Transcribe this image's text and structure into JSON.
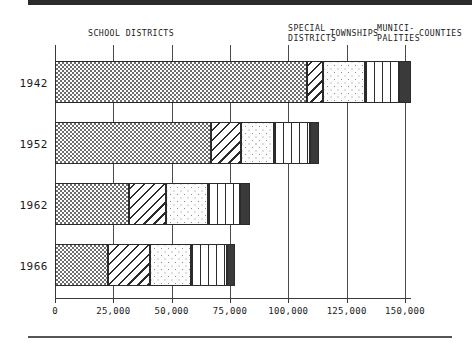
{
  "chart_data": {
    "type": "bar",
    "orientation": "horizontal",
    "stacked": true,
    "title": "",
    "xlabel": "",
    "ylabel": "",
    "categories": [
      "1942",
      "1952",
      "1962",
      "1966"
    ],
    "series": [
      {
        "name": "SCHOOL DISTRICTS",
        "pattern": "checker",
        "values": [
          108000,
          67000,
          31700,
          22700
        ]
      },
      {
        "name": "SPECIAL DISTRICTS",
        "pattern": "diagonal",
        "values": [
          6800,
          12900,
          15900,
          18000
        ]
      },
      {
        "name": "TOWNSHIPS",
        "pattern": "dots",
        "values": [
          18000,
          14100,
          18000,
          17600
        ]
      },
      {
        "name": "MUNICIPALITIES",
        "pattern": "vertical",
        "values": [
          14600,
          15400,
          13700,
          15400
        ]
      },
      {
        "name": "COUNTIES",
        "pattern": "solid",
        "values": [
          5100,
          3900,
          4300,
          3400
        ]
      }
    ],
    "totals": [
      150400,
      114400,
      82300,
      77100
    ],
    "xticks": [
      0,
      25000,
      50000,
      75000,
      100000,
      125000,
      150000
    ],
    "xtick_labels": [
      "0",
      "25,000",
      "50,000",
      "75,000",
      "100,000",
      "125,000",
      "150,000"
    ],
    "xlim": [
      0,
      150000
    ],
    "grid": true,
    "legend_position": "top-inline"
  },
  "headers": [
    {
      "label": "SCHOOL DISTRICTS",
      "name": "header-school-districts"
    },
    {
      "label": "SPECIAL\nDISTRICTS",
      "name": "header-special-districts"
    },
    {
      "label": "TOWNSHIPS",
      "name": "header-townships"
    },
    {
      "label": "MUNICI-\nPALITIES",
      "name": "header-municipalities"
    },
    {
      "label": "COUNTIES",
      "name": "header-counties"
    }
  ],
  "colors": {
    "ink": "#2b2b2b",
    "solid_segment": "#3a3a3a",
    "checker": "#6e6e6e",
    "dots": "#8a8a8a",
    "background": "#ffffff"
  }
}
